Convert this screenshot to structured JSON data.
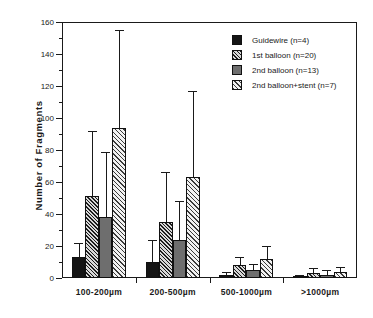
{
  "chart_data": {
    "type": "bar",
    "title": "",
    "xlabel": "",
    "ylabel": "Number  of  Fragments",
    "ylim": [
      0,
      160
    ],
    "ytick_step": 20,
    "yticks": [
      0,
      20,
      40,
      60,
      80,
      100,
      120,
      140,
      160
    ],
    "ytick_labels": [
      "0",
      "20",
      "40",
      "60",
      "80",
      "100",
      "120",
      "140",
      "160"
    ],
    "minor_tick_step": 10,
    "grid": false,
    "legend_position": "top-right",
    "error_bars": "upper-only",
    "categories": [
      "100-200µm",
      "200-500µm",
      "500-1000µm",
      ">1000µm"
    ],
    "series": [
      {
        "name": "Guidewire (n=4)",
        "fill": "solid-black",
        "color": "#151515",
        "values": [
          13,
          10,
          2,
          1
        ],
        "errors_upper": [
          22,
          24,
          4,
          2
        ]
      },
      {
        "name": "1st  balloon (n=20)",
        "fill": "crosshatch-dark",
        "color": "#1d1d1d",
        "values": [
          51,
          35,
          8,
          3
        ],
        "errors_upper": [
          92,
          66,
          13,
          6
        ]
      },
      {
        "name": "2nd balloon (n=13)",
        "fill": "gray",
        "color": "#6e6e6e",
        "values": [
          38,
          24,
          5,
          2
        ],
        "errors_upper": [
          79,
          48,
          9,
          5
        ]
      },
      {
        "name": "2nd balloon+stent (n=7)",
        "fill": "hatch-light",
        "color": "#efefef",
        "values": [
          94,
          63,
          12,
          4
        ]
      }
    ],
    "series_extra_errors": [
      155,
      117,
      20,
      7
    ]
  },
  "legend": {
    "items": [
      {
        "label": "Guidewire (n=4)",
        "swatch": "solid-black"
      },
      {
        "label": "1st  balloon (n=20)",
        "swatch": "crosshatch-dark"
      },
      {
        "label": "2nd balloon (n=13)",
        "swatch": "gray"
      },
      {
        "label": "2nd balloon+stent (n=7)",
        "swatch": "hatch-light"
      }
    ]
  }
}
